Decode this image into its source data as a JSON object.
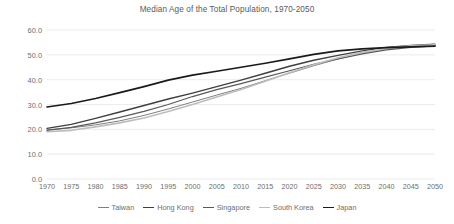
{
  "chart_data": {
    "type": "line",
    "title": "Median Age of the Total Population, 1970-2050",
    "xlabel": "",
    "ylabel": "",
    "x": [
      1970,
      1975,
      1980,
      1985,
      1990,
      1995,
      2000,
      2005,
      2010,
      2015,
      2020,
      2025,
      2030,
      2035,
      2040,
      2045,
      2050
    ],
    "xtick_labels": [
      "1970",
      "1975",
      "1980",
      "1985",
      "1990",
      "1995",
      "2000",
      "2005",
      "2010",
      "2015",
      "2020",
      "2025",
      "2030",
      "2035",
      "2040",
      "2045",
      "2050"
    ],
    "ytick_labels": [
      "0.0",
      "10.0",
      "20.0",
      "30.0",
      "40.0",
      "50.0",
      "60.0"
    ],
    "ytick_values": [
      0,
      10,
      20,
      30,
      40,
      50,
      60
    ],
    "ylim": [
      0,
      60
    ],
    "xlim": [
      1970,
      2050
    ],
    "grid": true,
    "grid_axis": "y",
    "legend_position": "bottom",
    "series": [
      {
        "name": "Taiwan",
        "color": "#808080",
        "width": 1.0,
        "values": [
          19.8,
          20.6,
          21.8,
          23.4,
          25.6,
          28.2,
          31.0,
          33.8,
          36.5,
          39.6,
          42.6,
          45.6,
          48.3,
          50.6,
          52.3,
          53.3,
          53.8
        ]
      },
      {
        "name": "Hong Kong",
        "color": "#3f3f3f",
        "width": 1.4,
        "values": [
          20.4,
          22.0,
          24.4,
          27.0,
          29.6,
          32.2,
          34.6,
          37.2,
          39.8,
          42.6,
          45.4,
          47.8,
          49.8,
          51.6,
          53.0,
          53.8,
          54.3
        ]
      },
      {
        "name": "Singapore",
        "color": "#595959",
        "width": 1.2,
        "values": [
          19.6,
          20.8,
          22.6,
          24.8,
          27.2,
          30.0,
          33.2,
          36.0,
          38.4,
          41.0,
          43.6,
          46.2,
          48.4,
          50.4,
          52.0,
          53.0,
          53.6
        ]
      },
      {
        "name": "South Korea",
        "color": "#bdbdbd",
        "width": 1.6,
        "values": [
          19.0,
          19.6,
          21.0,
          22.6,
          24.6,
          27.2,
          30.0,
          33.0,
          36.0,
          39.4,
          42.8,
          46.0,
          48.8,
          51.0,
          52.6,
          53.6,
          54.0
        ]
      },
      {
        "name": "Japan",
        "color": "#1a1a1a",
        "width": 1.7,
        "values": [
          29.0,
          30.4,
          32.4,
          34.8,
          37.2,
          39.8,
          41.8,
          43.4,
          45.0,
          46.6,
          48.4,
          50.2,
          51.6,
          52.4,
          52.9,
          53.2,
          53.5
        ]
      }
    ]
  }
}
